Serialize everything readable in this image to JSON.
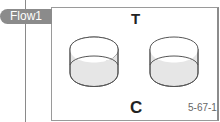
{
  "flow_tag": {
    "label": "Flow1",
    "color": "#8b8b8b"
  },
  "diagram": {
    "top_label": "T",
    "bottom_label": "C",
    "caption": "5-67-1",
    "objects": [
      {
        "name": "left-cylinder",
        "shape": "open cylinder",
        "fill": "#e6e6e6"
      },
      {
        "name": "right-cylinder",
        "shape": "open cylinder",
        "fill": "#e6e6e6"
      }
    ]
  }
}
